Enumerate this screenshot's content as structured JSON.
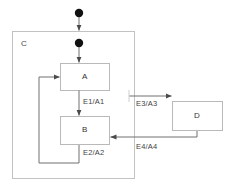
{
  "diagram": {
    "type": "uml-state-machine",
    "title": "",
    "colors": {
      "background": "#ffffff",
      "box_stroke": "#b9b9b9",
      "region_stroke": "#c2c2c2",
      "edge_stroke": "#707070",
      "initial_node_fill": "#111111",
      "text": "#3a3a3a"
    },
    "composite_state": {
      "name": "C",
      "label_x": 22,
      "label_y": 44,
      "x": 12,
      "y": 31,
      "w": 123,
      "h": 148
    },
    "states": [
      {
        "name": "A",
        "x": 60,
        "y": 63,
        "w": 50,
        "h": 28
      },
      {
        "name": "B",
        "x": 60,
        "y": 116,
        "w": 50,
        "h": 29
      },
      {
        "name": "D",
        "x": 172,
        "y": 101,
        "w": 51,
        "h": 30
      }
    ],
    "initial_nodes": [
      {
        "id": "initial-outer",
        "cx": 79,
        "cy": 13,
        "r": 4.2
      },
      {
        "id": "initial-inner",
        "cx": 79,
        "cy": 43,
        "r": 4.2
      }
    ],
    "transitions": [
      {
        "id": "t-initial-outer",
        "label": "",
        "from": "initial-outer",
        "to": "C"
      },
      {
        "id": "t-initial-inner",
        "label": "",
        "from": "initial-inner",
        "to": "A"
      },
      {
        "id": "t-a-b",
        "label": "E1/A1",
        "from": "A",
        "to": "B",
        "label_x": 87,
        "label_y": 100
      },
      {
        "id": "t-b-a",
        "label": "E2/A2",
        "from": "B",
        "to": "A",
        "label_x": 87,
        "label_y": 152
      },
      {
        "id": "t-c-d",
        "label": "E3/A3",
        "from": "C",
        "to": "D",
        "label_x": 139,
        "label_y": 103
      },
      {
        "id": "t-d-b",
        "label": "E4/A4",
        "from": "D",
        "to": "B",
        "label_x": 139,
        "label_y": 146
      }
    ]
  }
}
